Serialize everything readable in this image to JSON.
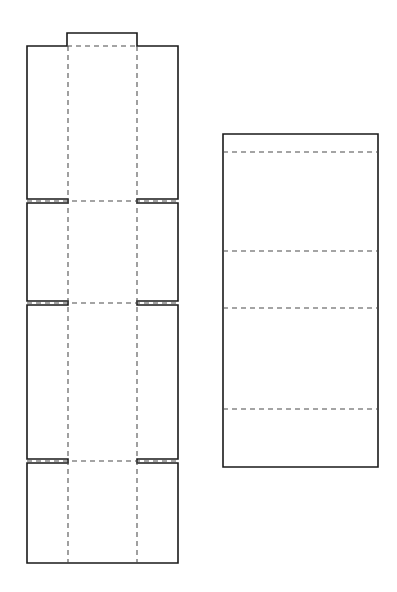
{
  "document": {
    "title": "Packaging Dieline Net",
    "background_color": "#ffffff",
    "width": 397,
    "height": 592
  },
  "style": {
    "cut_line_color": "#1a1a1a",
    "cut_line_width": 1.6,
    "fold_line_color": "#4a4a4a",
    "fold_line_width": 1.05,
    "fold_dash_pattern": "5 4",
    "panel_fill": "#ffffff"
  },
  "drawing": {
    "shapes": [
      {
        "name": "main-net-body",
        "type": "cut-path",
        "path": "M 67 33 L 137 33 L 137 46 L 178 46 L 178 199 L 137 199 L 137 203 L 178 203 L 178 301 L 137 301 L 137 305 L 178 305 L 178 459 L 137 459 L 137 463 L 178 463 L 178 563 L 27 563 L 27 463 L 68 463 L 68 459 L 27 459 L 27 305 L 68 305 L 68 301 L 27 301 L 27 203 L 68 203 L 68 199 L 27 199 L 27 46 L 67 46 Z"
      },
      {
        "name": "right-panel-body",
        "type": "cut-path",
        "path": "M 223 134 L 378 134 L 378 467 L 223 467 Z"
      }
    ],
    "fold_lines": [
      {
        "name": "fold-vertical-left",
        "x1": 68,
        "y1": 46,
        "x2": 68,
        "y2": 563
      },
      {
        "name": "fold-vertical-right",
        "x1": 137,
        "y1": 46,
        "x2": 137,
        "y2": 563
      },
      {
        "name": "fold-horizontal-top-tab",
        "x1": 67,
        "y1": 46,
        "x2": 137,
        "y2": 46
      },
      {
        "name": "fold-horizontal-1",
        "x1": 27,
        "y1": 201,
        "x2": 178,
        "y2": 201
      },
      {
        "name": "fold-horizontal-2",
        "x1": 27,
        "y1": 303,
        "x2": 178,
        "y2": 303
      },
      {
        "name": "fold-horizontal-3",
        "x1": 27,
        "y1": 461,
        "x2": 178,
        "y2": 461
      },
      {
        "name": "fold-right-1",
        "x1": 223,
        "y1": 152,
        "x2": 378,
        "y2": 152
      },
      {
        "name": "fold-right-2",
        "x1": 223,
        "y1": 251,
        "x2": 378,
        "y2": 251
      },
      {
        "name": "fold-right-3",
        "x1": 223,
        "y1": 308,
        "x2": 378,
        "y2": 308
      },
      {
        "name": "fold-right-4",
        "x1": 223,
        "y1": 409,
        "x2": 378,
        "y2": 409
      }
    ],
    "panels": [
      {
        "name": "panel-top-glue-tab",
        "x": 67,
        "y": 33,
        "w": 70,
        "h": 13
      },
      {
        "name": "panel-section-1-left",
        "x": 27,
        "y": 46,
        "w": 41,
        "h": 153
      },
      {
        "name": "panel-section-1-center",
        "x": 68,
        "y": 46,
        "w": 69,
        "h": 155
      },
      {
        "name": "panel-section-1-right",
        "x": 137,
        "y": 46,
        "w": 41,
        "h": 153
      },
      {
        "name": "panel-section-2-left",
        "x": 27,
        "y": 203,
        "w": 41,
        "h": 98
      },
      {
        "name": "panel-section-2-center",
        "x": 68,
        "y": 201,
        "w": 69,
        "h": 102
      },
      {
        "name": "panel-section-2-right",
        "x": 137,
        "y": 203,
        "w": 41,
        "h": 98
      },
      {
        "name": "panel-section-3-left",
        "x": 27,
        "y": 305,
        "w": 41,
        "h": 154
      },
      {
        "name": "panel-section-3-center",
        "x": 68,
        "y": 303,
        "w": 69,
        "h": 158
      },
      {
        "name": "panel-section-3-right",
        "x": 137,
        "y": 305,
        "w": 41,
        "h": 154
      },
      {
        "name": "panel-section-4-left",
        "x": 27,
        "y": 463,
        "w": 41,
        "h": 100
      },
      {
        "name": "panel-section-4-center",
        "x": 68,
        "y": 461,
        "w": 69,
        "h": 102
      },
      {
        "name": "panel-section-4-right",
        "x": 137,
        "y": 463,
        "w": 41,
        "h": 100
      },
      {
        "name": "panel-right-band-1",
        "x": 223,
        "y": 134,
        "w": 155,
        "h": 18
      },
      {
        "name": "panel-right-band-2",
        "x": 223,
        "y": 152,
        "w": 155,
        "h": 99
      },
      {
        "name": "panel-right-band-3",
        "x": 223,
        "y": 251,
        "w": 155,
        "h": 57
      },
      {
        "name": "panel-right-band-4",
        "x": 223,
        "y": 308,
        "w": 155,
        "h": 101
      },
      {
        "name": "panel-right-band-5",
        "x": 223,
        "y": 409,
        "w": 155,
        "h": 58
      }
    ]
  }
}
